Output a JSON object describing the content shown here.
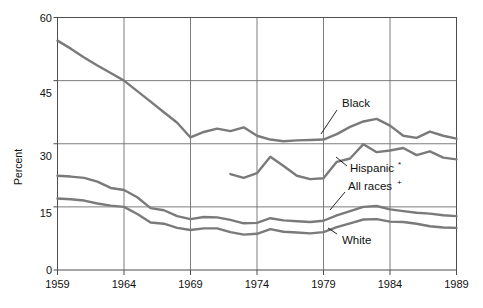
{
  "chart_data": {
    "type": "line",
    "title": "",
    "xlabel": "",
    "ylabel": "Percent",
    "xlim": [
      1959,
      1989
    ],
    "ylim": [
      0,
      60
    ],
    "yticks": [
      0,
      15,
      30,
      45,
      60
    ],
    "xticks": [
      1959,
      1964,
      1969,
      1974,
      1979,
      1984,
      1989
    ],
    "grid": true,
    "legend": "inline-annotations",
    "series": [
      {
        "name": "Black",
        "label": "Black",
        "color": "#7a7a7a",
        "x": [
          1959,
          1960,
          1961,
          1962,
          1963,
          1964,
          1965,
          1966,
          1967,
          1968,
          1969,
          1970,
          1971,
          1972,
          1973,
          1974,
          1975,
          1976,
          1977,
          1978,
          1979,
          1980,
          1981,
          1982,
          1983,
          1984,
          1985,
          1986,
          1987,
          1988,
          1989
        ],
        "values": [
          54.5,
          52.6,
          50.5,
          48.6,
          46.8,
          45.0,
          42.5,
          40.0,
          37.5,
          35.0,
          31.5,
          32.8,
          33.6,
          33.0,
          33.9,
          31.9,
          31.0,
          30.6,
          30.8,
          30.9,
          31.0,
          32.3,
          34.0,
          35.3,
          35.9,
          34.3,
          31.9,
          31.4,
          32.9,
          31.9,
          31.2
        ]
      },
      {
        "name": "Hispanic",
        "label": "Hispanic*",
        "color": "#7a7a7a",
        "x": [
          1972,
          1973,
          1974,
          1975,
          1976,
          1977,
          1978,
          1979,
          1980,
          1981,
          1982,
          1983,
          1984,
          1985,
          1986,
          1987,
          1988,
          1989
        ],
        "values": [
          22.8,
          21.9,
          23.0,
          26.9,
          24.7,
          22.4,
          21.6,
          21.8,
          25.7,
          26.5,
          29.9,
          28.0,
          28.4,
          29.0,
          27.3,
          28.2,
          26.7,
          26.3
        ]
      },
      {
        "name": "All races",
        "label": "All races",
        "color": "#7a7a7a",
        "x": [
          1959,
          1960,
          1961,
          1962,
          1963,
          1964,
          1965,
          1966,
          1967,
          1968,
          1969,
          1970,
          1971,
          1972,
          1973,
          1974,
          1975,
          1976,
          1977,
          1978,
          1979,
          1980,
          1981,
          1982,
          1983,
          1984,
          1985,
          1986,
          1987,
          1988,
          1989
        ],
        "values": [
          22.4,
          22.2,
          21.9,
          21.0,
          19.5,
          19.0,
          17.3,
          14.7,
          14.2,
          12.8,
          12.1,
          12.6,
          12.5,
          11.9,
          11.1,
          11.2,
          12.3,
          11.8,
          11.6,
          11.4,
          11.7,
          13.0,
          14.0,
          15.0,
          15.2,
          14.4,
          14.0,
          13.6,
          13.4,
          13.0,
          12.8
        ]
      },
      {
        "name": "White",
        "label": "White",
        "color": "#7a7a7a",
        "x": [
          1959,
          1960,
          1961,
          1962,
          1963,
          1964,
          1965,
          1966,
          1967,
          1968,
          1969,
          1970,
          1971,
          1972,
          1973,
          1974,
          1975,
          1976,
          1977,
          1978,
          1979,
          1980,
          1981,
          1982,
          1983,
          1984,
          1985,
          1986,
          1987,
          1988,
          1989
        ],
        "values": [
          17.0,
          16.8,
          16.5,
          15.8,
          15.3,
          15.0,
          13.3,
          11.3,
          11.0,
          10.0,
          9.5,
          9.9,
          9.9,
          9.0,
          8.4,
          8.6,
          9.7,
          9.1,
          8.9,
          8.7,
          9.0,
          10.2,
          11.1,
          12.0,
          12.1,
          11.5,
          11.4,
          11.0,
          10.4,
          10.1,
          10.0
        ]
      }
    ],
    "annotations": [
      {
        "text": "Black",
        "x": 1978.5,
        "y": 39.5
      },
      {
        "text": "Hispanic*",
        "x": 1978.7,
        "y": 25.0
      },
      {
        "text": "All races+",
        "x": 1978.5,
        "y": 20.0
      },
      {
        "text": "White",
        "x": 1979.5,
        "y": 7.2
      }
    ]
  },
  "axis": {
    "y_title": "Percent",
    "y_tick_labels": [
      "60",
      "45",
      "30",
      "15",
      "0"
    ],
    "x_tick_labels": [
      "1959",
      "1964",
      "1969",
      "1974",
      "1979",
      "1984",
      "1989"
    ]
  },
  "labels": {
    "black": "Black",
    "hispanic": "Hispanic",
    "hispanic_mark": "*",
    "all_races": "All races",
    "all_races_mark": "+",
    "white": "White"
  },
  "colors": {
    "line": "#7a7a7a",
    "axis": "#4d4d4d",
    "grid": "#6e6e6e",
    "text": "#111111",
    "background": "#ffffff"
  }
}
